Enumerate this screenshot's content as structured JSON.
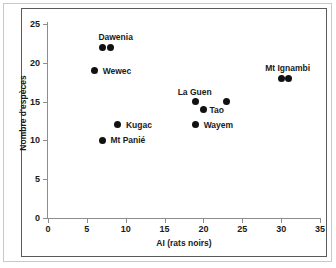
{
  "chart_data": {
    "type": "scatter",
    "title": "",
    "xlabel": "AI (rats noirs)",
    "ylabel": "Nombre d'espèces",
    "xlim": [
      0,
      35
    ],
    "ylim": [
      0,
      25
    ],
    "xticks": [
      0,
      5,
      10,
      15,
      20,
      25,
      30,
      35
    ],
    "yticks": [
      0,
      5,
      10,
      15,
      20,
      25
    ],
    "grid": false,
    "legend": "none",
    "marker": "filled-circle",
    "marker_color": "#111111",
    "points": [
      {
        "label": "Dawenia",
        "x": 7,
        "y": 22,
        "label_dx": -4,
        "label_dy": -15,
        "label_align": "left"
      },
      {
        "label": "",
        "x": 8,
        "y": 22,
        "label_dx": 0,
        "label_dy": 0,
        "label_align": "left"
      },
      {
        "label": "Wewec",
        "x": 6,
        "y": 19,
        "label_dx": 8,
        "label_dy": -5,
        "label_align": "left"
      },
      {
        "label": "Mt Ignambi",
        "x": 30,
        "y": 18,
        "label_dx": -16,
        "label_dy": -15,
        "label_align": "left"
      },
      {
        "label": "",
        "x": 31,
        "y": 18,
        "label_dx": 0,
        "label_dy": 0,
        "label_align": "left"
      },
      {
        "label": "La Guen",
        "x": 19,
        "y": 15,
        "label_dx": -18,
        "label_dy": -15,
        "label_align": "left"
      },
      {
        "label": "",
        "x": 23,
        "y": 15,
        "label_dx": 0,
        "label_dy": 0,
        "label_align": "left"
      },
      {
        "label": "Tao",
        "x": 20,
        "y": 14,
        "label_dx": 6,
        "label_dy": -4,
        "label_align": "left"
      },
      {
        "label": "Wayem",
        "x": 19,
        "y": 12,
        "label_dx": 8,
        "label_dy": -5,
        "label_align": "left"
      },
      {
        "label": "Kugac",
        "x": 9,
        "y": 12,
        "label_dx": 8,
        "label_dy": -5,
        "label_align": "left"
      },
      {
        "label": "Mt Panié",
        "x": 7,
        "y": 10,
        "label_dx": 8,
        "label_dy": -5,
        "label_align": "left"
      }
    ]
  },
  "axes": {
    "x_title": "AI (rats noirs)",
    "y_title": "Nombre d'espèces",
    "x_tick_labels": [
      "0",
      "5",
      "10",
      "15",
      "20",
      "25",
      "30",
      "35"
    ],
    "y_tick_labels": [
      "0",
      "5",
      "10",
      "15",
      "20",
      "25"
    ]
  },
  "colors": {
    "marker": "#111111",
    "axis": "#8d8d8d",
    "plot_border": "#5a5a5a",
    "outer_frame": "#c9c9c9",
    "text": "#1a1a1a",
    "background": "#ffffff"
  }
}
